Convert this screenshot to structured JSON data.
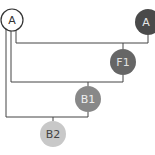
{
  "diagram": {
    "type": "tree",
    "nodes": [
      {
        "id": "a_root",
        "label": "A",
        "fill": "#ffffff",
        "stroke": "#333333",
        "text_color": "#333333",
        "cx": 12,
        "cy": 20,
        "r": 11
      },
      {
        "id": "a_dark",
        "label": "A",
        "fill": "#4a4a4a",
        "stroke": "#4a4a4a",
        "text_color": "#e8e8e8",
        "cx": 148,
        "cy": 22,
        "r": 13
      },
      {
        "id": "f1",
        "label": "F1",
        "fill": "#666666",
        "stroke": "#666666",
        "text_color": "#e0e0e0",
        "cx": 123,
        "cy": 62,
        "r": 13
      },
      {
        "id": "b1",
        "label": "B1",
        "fill": "#888888",
        "stroke": "#888888",
        "text_color": "#eeeeee",
        "cx": 88,
        "cy": 99,
        "r": 13
      },
      {
        "id": "b2",
        "label": "B2",
        "fill": "#c8c8c8",
        "stroke": "#c8c8c8",
        "text_color": "#444444",
        "cx": 53,
        "cy": 134,
        "r": 13
      }
    ],
    "edges": [
      {
        "from": "a_root",
        "to": "a_dark"
      },
      {
        "from": "a_root",
        "to": "f1"
      },
      {
        "from": "f1",
        "to": "b1"
      },
      {
        "from": "b1",
        "to": "b2"
      }
    ],
    "line_color": "#444444"
  }
}
